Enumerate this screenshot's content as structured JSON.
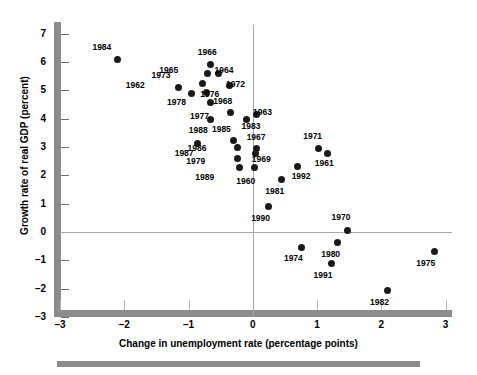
{
  "chart_data": {
    "type": "scatter",
    "title": "",
    "xlabel": "Change in unemployment rate (percentage points)",
    "ylabel": "Growth rate of real GDP (percent)",
    "xlim": [
      -3,
      3.1
    ],
    "ylim": [
      -3,
      7.3
    ],
    "xticks": [
      -3,
      -2,
      -1,
      0,
      1,
      2,
      3
    ],
    "xticklabels": [
      "–3",
      "–2",
      "–1",
      "0",
      "1",
      "2",
      "3"
    ],
    "yticks": [
      -3,
      -2,
      -1,
      0,
      1,
      2,
      3,
      4,
      5,
      6,
      7
    ],
    "yticklabels": [
      "–3",
      "–2",
      "–1",
      "0",
      "1",
      "2",
      "3",
      "4",
      "5",
      "6",
      "7"
    ],
    "grid": false,
    "legend": "none",
    "reference_lines": [
      {
        "axis": "x",
        "value": 0
      },
      {
        "axis": "y",
        "value": 0
      }
    ],
    "marker_color": "#1a1a1a",
    "axis_color": "#8c8c8c",
    "points": [
      {
        "label": "1984",
        "x": -2.1,
        "y": 6.1,
        "lx": -0.24,
        "ly": 0.42
      },
      {
        "label": "1966",
        "x": -0.66,
        "y": 5.9,
        "lx": -0.04,
        "ly": 0.42
      },
      {
        "label": "1965",
        "x": -0.7,
        "y": 5.58,
        "lx": -0.6,
        "ly": 0.13
      },
      {
        "label": "1964",
        "x": -0.54,
        "y": 5.58,
        "lx": 0.1,
        "ly": 0.1
      },
      {
        "label": "1973",
        "x": -0.78,
        "y": 5.25,
        "lx": -0.64,
        "ly": 0.26
      },
      {
        "label": "1962",
        "x": -1.16,
        "y": 5.1,
        "lx": -0.66,
        "ly": 0.06
      },
      {
        "label": "1972",
        "x": -0.36,
        "y": 5.15,
        "lx": 0.1,
        "ly": 0.05
      },
      {
        "label": "1976",
        "x": -0.72,
        "y": 4.92,
        "lx": 0.06,
        "ly": -0.07
      },
      {
        "label": "1978",
        "x": -0.96,
        "y": 4.87,
        "lx": -0.22,
        "ly": -0.32
      },
      {
        "label": "1977",
        "x": -0.66,
        "y": 4.55,
        "lx": -0.16,
        "ly": -0.48
      },
      {
        "label": "1968",
        "x": -0.34,
        "y": 4.21,
        "lx": -0.12,
        "ly": 0.4
      },
      {
        "label": "1963",
        "x": 0.06,
        "y": 4.15,
        "lx": 0.1,
        "ly": 0.08
      },
      {
        "label": "1983",
        "x": -0.1,
        "y": 3.95,
        "lx": 0.08,
        "ly": -0.22
      },
      {
        "label": "1988",
        "x": -0.66,
        "y": 3.98,
        "lx": -0.18,
        "ly": -0.4
      },
      {
        "label": "1985",
        "x": -0.3,
        "y": 3.22,
        "lx": -0.18,
        "ly": 0.4
      },
      {
        "label": "1987",
        "x": -0.86,
        "y": 3.12,
        "lx": -0.2,
        "ly": -0.36
      },
      {
        "label": "1971",
        "x": 1.02,
        "y": 2.93,
        "lx": -0.08,
        "ly": 0.42
      },
      {
        "label": "1967",
        "x": 0.06,
        "y": 2.95,
        "lx": 0.0,
        "ly": 0.38
      },
      {
        "label": "1986",
        "x": -0.24,
        "y": 2.98,
        "lx": -0.62,
        "ly": -0.02
      },
      {
        "label": "1961",
        "x": 1.16,
        "y": 2.78,
        "lx": -0.04,
        "ly": -0.38
      },
      {
        "label": "1979",
        "x": -0.24,
        "y": 2.6,
        "lx": -0.64,
        "ly": -0.1
      },
      {
        "label": "1969",
        "x": 0.04,
        "y": 2.76,
        "lx": 0.1,
        "ly": -0.22
      },
      {
        "label": "1992",
        "x": 0.7,
        "y": 2.32,
        "lx": 0.06,
        "ly": -0.38
      },
      {
        "label": "1989",
        "x": -0.2,
        "y": 2.27,
        "lx": -0.54,
        "ly": -0.34
      },
      {
        "label": "1960",
        "x": 0.02,
        "y": 2.27,
        "lx": -0.12,
        "ly": -0.48
      },
      {
        "label": "1981",
        "x": 0.45,
        "y": 1.85,
        "lx": -0.1,
        "ly": -0.42
      },
      {
        "label": "1990",
        "x": 0.25,
        "y": 0.9,
        "lx": -0.12,
        "ly": -0.44
      },
      {
        "label": "1970",
        "x": 1.48,
        "y": 0.06,
        "lx": -0.1,
        "ly": 0.46
      },
      {
        "label": "1980",
        "x": 1.32,
        "y": -0.38,
        "lx": -0.1,
        "ly": -0.4
      },
      {
        "label": "1974",
        "x": 0.76,
        "y": -0.55,
        "lx": -0.12,
        "ly": -0.4
      },
      {
        "label": "1975",
        "x": 2.82,
        "y": -0.7,
        "lx": -0.12,
        "ly": -0.42
      },
      {
        "label": "1991",
        "x": 1.22,
        "y": -1.1,
        "lx": -0.12,
        "ly": -0.42
      },
      {
        "label": "1982",
        "x": 2.1,
        "y": -2.08,
        "lx": -0.12,
        "ly": -0.42
      }
    ]
  }
}
